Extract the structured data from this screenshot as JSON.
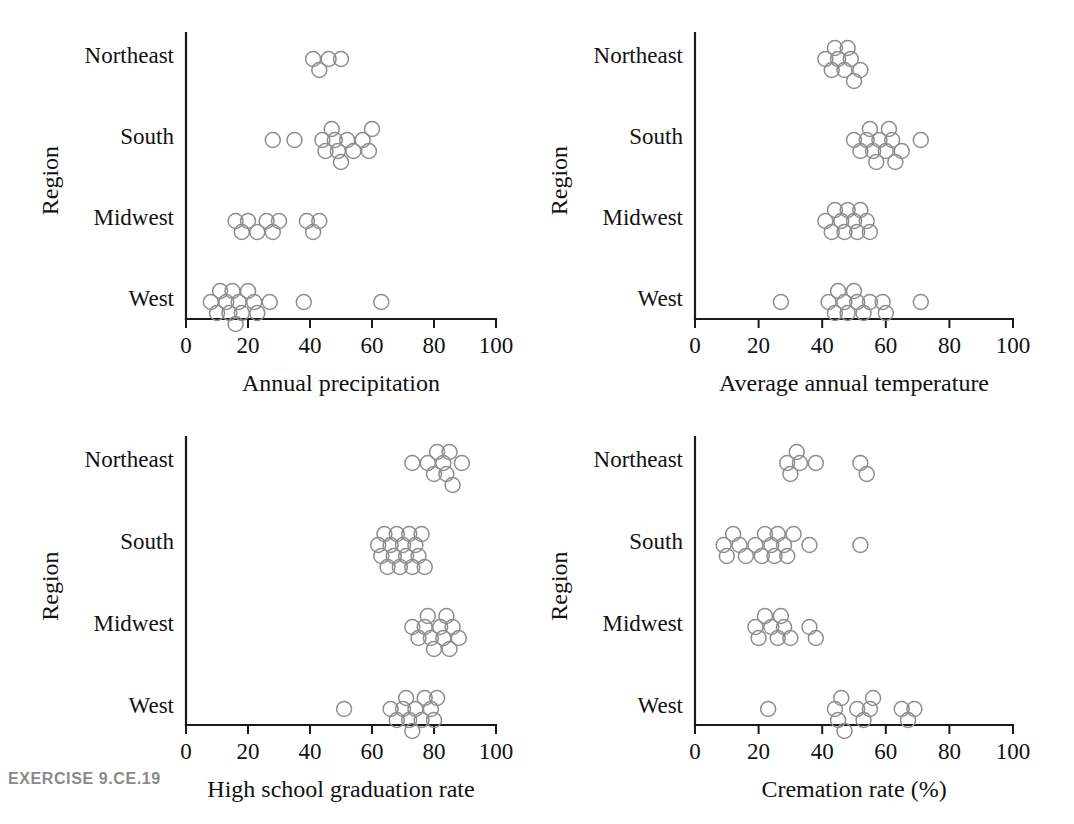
{
  "caption": "EXERCISE 9.CE.19",
  "common": {
    "ylabel": "Region",
    "categories": [
      "Northeast",
      "South",
      "Midwest",
      "West"
    ],
    "xticks": [
      "0",
      "20",
      "40",
      "60",
      "80",
      "100"
    ],
    "xtickvalues": [
      0,
      20,
      40,
      60,
      80,
      100
    ],
    "xlim": [
      0,
      100
    ],
    "marker": "open-circle",
    "marker_color": "#8e8e8e",
    "axis_color": "#1a1a1a",
    "grid": false,
    "legend": "none"
  },
  "chart_data": [
    {
      "id": "annual-precipitation",
      "type": "scatter",
      "title": "",
      "xlabel": "Annual precipitation",
      "ylabel": "Region",
      "xlim": [
        0,
        100
      ],
      "xticks": [
        0,
        20,
        40,
        60,
        80,
        100
      ],
      "categories": [
        "Northeast",
        "South",
        "Midwest",
        "West"
      ],
      "series": [
        {
          "name": "Northeast",
          "values": [
            41,
            43,
            46,
            50
          ]
        },
        {
          "name": "South",
          "values": [
            28,
            35,
            44,
            45,
            47,
            48,
            49,
            50,
            52,
            54,
            57,
            59,
            60
          ]
        },
        {
          "name": "Midwest",
          "values": [
            16,
            18,
            20,
            23,
            26,
            28,
            30,
            39,
            41,
            43
          ]
        },
        {
          "name": "West",
          "values": [
            8,
            10,
            11,
            13,
            14,
            15,
            16,
            17,
            18,
            20,
            22,
            23,
            27,
            38,
            63
          ]
        }
      ]
    },
    {
      "id": "average-annual-temperature",
      "type": "scatter",
      "title": "",
      "xlabel": "Average annual temperature",
      "ylabel": "Region",
      "xlim": [
        0,
        100
      ],
      "xticks": [
        0,
        20,
        40,
        60,
        80,
        100
      ],
      "categories": [
        "Northeast",
        "South",
        "Midwest",
        "West"
      ],
      "series": [
        {
          "name": "Northeast",
          "values": [
            41,
            43,
            44,
            45,
            47,
            48,
            49,
            50,
            52
          ]
        },
        {
          "name": "South",
          "values": [
            50,
            52,
            54,
            55,
            56,
            57,
            58,
            60,
            61,
            62,
            63,
            65,
            71
          ]
        },
        {
          "name": "Midwest",
          "values": [
            41,
            43,
            44,
            46,
            47,
            48,
            50,
            51,
            52,
            54,
            55
          ]
        },
        {
          "name": "West",
          "values": [
            27,
            42,
            44,
            45,
            47,
            48,
            50,
            51,
            53,
            55,
            59,
            60,
            71
          ]
        }
      ]
    },
    {
      "id": "high-school-graduation-rate",
      "type": "scatter",
      "title": "",
      "xlabel": "High school graduation rate",
      "ylabel": "Region",
      "xlim": [
        0,
        100
      ],
      "xticks": [
        0,
        20,
        40,
        60,
        80,
        100
      ],
      "categories": [
        "Northeast",
        "South",
        "Midwest",
        "West"
      ],
      "series": [
        {
          "name": "Northeast",
          "values": [
            73,
            78,
            80,
            81,
            83,
            84,
            85,
            86,
            89
          ]
        },
        {
          "name": "South",
          "values": [
            62,
            63,
            64,
            65,
            66,
            67,
            68,
            69,
            70,
            71,
            72,
            73,
            74,
            75,
            76,
            77
          ]
        },
        {
          "name": "Midwest",
          "values": [
            73,
            75,
            77,
            78,
            79,
            80,
            82,
            83,
            84,
            85,
            86,
            88
          ]
        },
        {
          "name": "West",
          "values": [
            51,
            66,
            68,
            70,
            71,
            72,
            73,
            74,
            76,
            77,
            79,
            80,
            81
          ]
        }
      ]
    },
    {
      "id": "cremation-rate",
      "type": "scatter",
      "title": "",
      "xlabel": "Cremation rate (%)",
      "ylabel": "Region",
      "xlim": [
        0,
        100
      ],
      "xticks": [
        0,
        20,
        40,
        60,
        80,
        100
      ],
      "categories": [
        "Northeast",
        "South",
        "Midwest",
        "West"
      ],
      "series": [
        {
          "name": "Northeast",
          "values": [
            29,
            30,
            32,
            33,
            38,
            52,
            54
          ]
        },
        {
          "name": "South",
          "values": [
            9,
            10,
            12,
            14,
            16,
            19,
            21,
            22,
            24,
            25,
            26,
            28,
            29,
            31,
            36,
            52
          ]
        },
        {
          "name": "Midwest",
          "values": [
            19,
            20,
            22,
            24,
            26,
            27,
            28,
            30,
            36,
            38
          ]
        },
        {
          "name": "West",
          "values": [
            23,
            44,
            45,
            46,
            47,
            51,
            53,
            55,
            56,
            65,
            67,
            69
          ]
        }
      ]
    }
  ]
}
